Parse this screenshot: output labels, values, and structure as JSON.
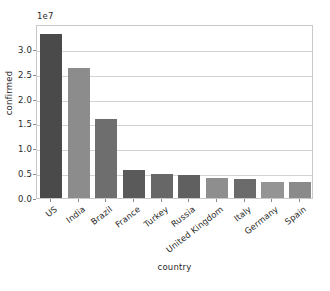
{
  "chart_data": {
    "type": "bar",
    "title": "",
    "xlabel": "country",
    "ylabel": "confirmed",
    "offset_text": "1e7",
    "categories": [
      "US",
      "India",
      "Brazil",
      "France",
      "Turkey",
      "Russia",
      "United Kingdom",
      "Italy",
      "Germany",
      "Spain"
    ],
    "values": [
      32900000,
      26200000,
      15900000,
      5700000,
      4900000,
      4550000,
      4100000,
      3750000,
      3200000,
      3150000
    ],
    "values_scaled": [
      3.29,
      2.62,
      1.59,
      0.57,
      0.49,
      0.455,
      0.41,
      0.375,
      0.32,
      0.315
    ],
    "bar_colors": [
      "#4a4a4a",
      "#8c8c8c",
      "#6e6e6e",
      "#5a5a5a",
      "#676767",
      "#606060",
      "#8e8e8e",
      "#6b6b6b",
      "#949494",
      "#8a8a8a"
    ],
    "ylim": [
      0,
      3.5
    ],
    "ytick_labels": [
      "0.0",
      "0.5",
      "1.0",
      "1.5",
      "2.0",
      "2.5",
      "3.0"
    ],
    "ytick_values": [
      0.0,
      0.5,
      1.0,
      1.5,
      2.0,
      2.5,
      3.0
    ],
    "grid": true,
    "legend": "none",
    "axis_color": "#c9c9c9",
    "grid_color": "#d3d3d3",
    "background": "#ffffff"
  }
}
